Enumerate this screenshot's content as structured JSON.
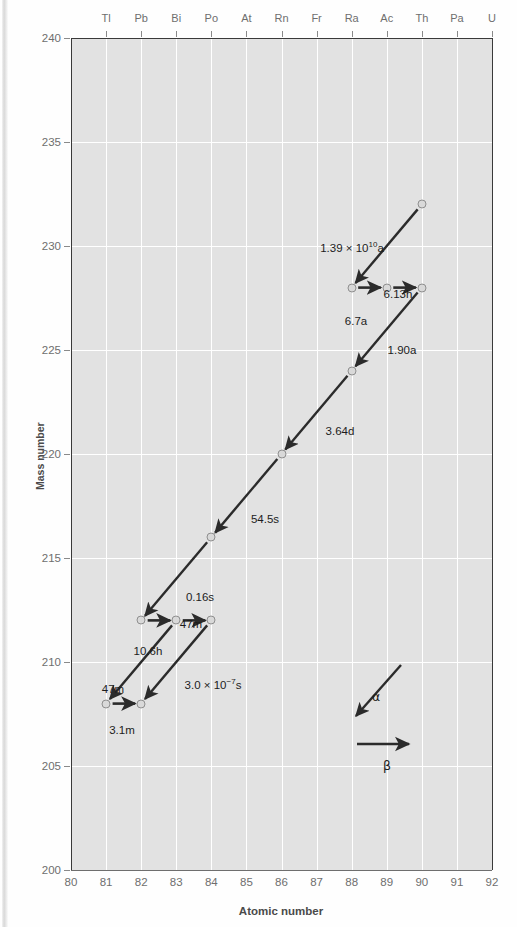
{
  "chart_data": {
    "type": "scatter",
    "title": "",
    "xlabel": "Atomic number",
    "ylabel": "Mass number",
    "xlim": [
      80,
      92
    ],
    "ylim": [
      200,
      240
    ],
    "grid": true,
    "legend_position": "inside-lower-right",
    "x_ticks": [
      80,
      81,
      82,
      83,
      84,
      85,
      86,
      87,
      88,
      89,
      90,
      91,
      92
    ],
    "y_ticks": [
      200,
      205,
      210,
      215,
      220,
      225,
      230,
      235,
      240
    ],
    "top_axis_label": "element symbol",
    "element_symbols": [
      {
        "z": 81,
        "symbol": "Tl"
      },
      {
        "z": 82,
        "symbol": "Pb"
      },
      {
        "z": 83,
        "symbol": "Bi"
      },
      {
        "z": 84,
        "symbol": "Po"
      },
      {
        "z": 85,
        "symbol": "At"
      },
      {
        "z": 86,
        "symbol": "Rn"
      },
      {
        "z": 87,
        "symbol": "Fr"
      },
      {
        "z": 88,
        "symbol": "Ra"
      },
      {
        "z": 89,
        "symbol": "Ac"
      },
      {
        "z": 90,
        "symbol": "Th"
      },
      {
        "z": 91,
        "symbol": "Pa"
      },
      {
        "z": 92,
        "symbol": "U"
      }
    ],
    "nodes": [
      {
        "z": 90,
        "a": 232
      },
      {
        "z": 88,
        "a": 228
      },
      {
        "z": 89,
        "a": 228
      },
      {
        "z": 90,
        "a": 228
      },
      {
        "z": 88,
        "a": 224
      },
      {
        "z": 86,
        "a": 220
      },
      {
        "z": 84,
        "a": 216
      },
      {
        "z": 82,
        "a": 212
      },
      {
        "z": 83,
        "a": 212
      },
      {
        "z": 84,
        "a": 212
      },
      {
        "z": 81,
        "a": 208
      },
      {
        "z": 82,
        "a": 208
      }
    ],
    "decays": [
      {
        "from": [
          90,
          232
        ],
        "to": [
          88,
          228
        ],
        "type": "alpha",
        "halflife": "1.39 × 10",
        "halflife_exp": "10",
        "halflife_suffix": "a",
        "label_x": 352,
        "label_y": 240
      },
      {
        "from": [
          88,
          228
        ],
        "to": [
          89,
          228
        ],
        "type": "beta",
        "halflife": "6.7a",
        "label_x": 356,
        "label_y": 315
      },
      {
        "from": [
          89,
          228
        ],
        "to": [
          90,
          228
        ],
        "type": "beta",
        "halflife": "6.13h",
        "label_x": 398,
        "label_y": 288
      },
      {
        "from": [
          90,
          228
        ],
        "to": [
          88,
          224
        ],
        "type": "alpha",
        "halflife": "1.90a",
        "label_x": 402,
        "label_y": 344
      },
      {
        "from": [
          88,
          224
        ],
        "to": [
          86,
          220
        ],
        "type": "alpha",
        "halflife": "3.64d",
        "label_x": 340,
        "label_y": 425
      },
      {
        "from": [
          86,
          220
        ],
        "to": [
          84,
          216
        ],
        "type": "alpha",
        "halflife": "54.5s",
        "label_x": 265,
        "label_y": 513
      },
      {
        "from": [
          84,
          216
        ],
        "to": [
          82,
          212
        ],
        "type": "alpha",
        "halflife": "0.16s",
        "label_x": 200,
        "label_y": 591
      },
      {
        "from": [
          82,
          212
        ],
        "to": [
          83,
          212
        ],
        "type": "beta",
        "halflife": "10.6h",
        "label_x": 148,
        "label_y": 645
      },
      {
        "from": [
          83,
          212
        ],
        "to": [
          84,
          212
        ],
        "type": "beta",
        "halflife": "47m",
        "label_x": 191,
        "label_y": 618
      },
      {
        "from": [
          83,
          212
        ],
        "to": [
          81,
          208
        ],
        "type": "alpha",
        "halflife": "47m",
        "label_x": 113,
        "label_y": 683
      },
      {
        "from": [
          84,
          212
        ],
        "to": [
          82,
          208
        ],
        "type": "alpha",
        "halflife": "3.0 × 10",
        "halflife_exp": "−7",
        "halflife_suffix": "s",
        "label_x": 213,
        "label_y": 677
      },
      {
        "from": [
          81,
          208
        ],
        "to": [
          82,
          208
        ],
        "type": "beta",
        "halflife": "3.1m",
        "label_x": 122,
        "label_y": 724
      }
    ],
    "legend": [
      {
        "symbol": "α",
        "meaning": "alpha decay",
        "label_x": 372,
        "label_y": 689
      },
      {
        "symbol": "β",
        "meaning": "beta decay",
        "label_x": 383,
        "label_y": 758
      }
    ],
    "colors": {
      "plot_background": "#e2e2e2",
      "gridline": "#ffffff",
      "arrow": "#2b2b2b",
      "marker_fill": "#d9d9d9",
      "marker_edge": "#8f8f8f",
      "tick_text": "#6e6e6e",
      "axis_title": "#4a4a4a"
    }
  }
}
